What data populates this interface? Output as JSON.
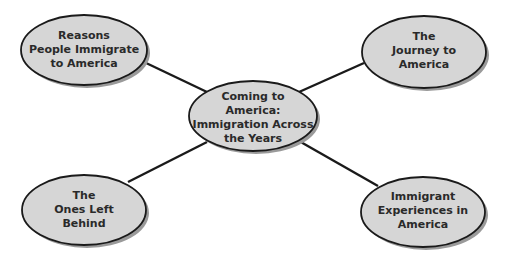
{
  "diagram": {
    "type": "web-organizer",
    "colors": {
      "node_fill": "#d6d6d6",
      "node_stroke": "#1a1a1a",
      "shadow": "#9a9a9a",
      "connector": "#1a1a1a",
      "background": "#ffffff"
    },
    "center": {
      "lines": [
        "Coming to",
        "America:",
        "Immigration Across",
        "the Years"
      ]
    },
    "nodes": [
      {
        "id": "top-left",
        "lines": [
          "Reasons",
          "People Immigrate",
          "to America"
        ]
      },
      {
        "id": "top-right",
        "lines": [
          "The",
          "Journey to",
          "America"
        ]
      },
      {
        "id": "bottom-left",
        "lines": [
          "The",
          "Ones Left",
          "Behind"
        ]
      },
      {
        "id": "bottom-right",
        "lines": [
          "Immigrant",
          "Experiences in",
          "America"
        ]
      }
    ]
  }
}
